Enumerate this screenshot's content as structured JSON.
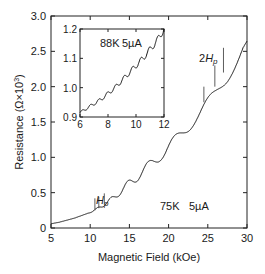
{
  "chart_data": [
    {
      "id": "main",
      "type": "line",
      "title": "",
      "xlabel": "Magnetic Field (kOe)",
      "ylabel": "Resistance (Ω×10",
      "ylabel_sup": "3",
      "ylabel_close": ")",
      "xlim": [
        5,
        30
      ],
      "ylim": [
        0,
        3.0
      ],
      "xticks": [
        5,
        10,
        15,
        20,
        25,
        30
      ],
      "xtick_labels": [
        "5",
        "10",
        "15",
        "20",
        "25",
        "30"
      ],
      "yticks": [
        0,
        0.5,
        1.0,
        1.5,
        2.0,
        2.5,
        3.0
      ],
      "ytick_labels": [
        "0",
        "0.5",
        "1.0",
        "1.5",
        "2.0",
        "2.5",
        "3.0"
      ],
      "grid": false,
      "series": [
        {
          "name": "75K 5µA",
          "x": [
            5,
            6,
            7,
            8,
            9,
            10,
            10.5,
            11,
            11.5,
            12,
            12.5,
            13,
            13.5,
            14,
            14.5,
            15,
            15.5,
            16,
            16.5,
            17,
            17.5,
            18,
            18.5,
            19,
            19.5,
            20,
            20.5,
            21,
            21.5,
            22,
            22.5,
            23,
            23.5,
            24,
            24.5,
            25,
            25.5,
            26,
            26.5,
            27,
            27.5,
            28,
            28.5,
            29,
            29.5,
            30
          ],
          "y": [
            0.06,
            0.08,
            0.11,
            0.14,
            0.18,
            0.22,
            0.25,
            0.28,
            0.31,
            0.35,
            0.39,
            0.43,
            0.48,
            0.53,
            0.58,
            0.63,
            0.68,
            0.73,
            0.78,
            0.83,
            0.88,
            0.93,
            0.98,
            1.03,
            1.08,
            1.14,
            1.2,
            1.26,
            1.32,
            1.38,
            1.44,
            1.5,
            1.56,
            1.62,
            1.69,
            1.76,
            1.83,
            1.9,
            1.98,
            2.06,
            2.15,
            2.25,
            2.35,
            2.45,
            2.55,
            2.6
          ],
          "oscillation_period_kOe": 0.6,
          "oscillation_amplitude": 0.06
        }
      ],
      "annotations": [
        {
          "text": "Hp",
          "italic": true,
          "x": 11.0,
          "y": 0.45
        },
        {
          "text": "2Hp",
          "italic": true,
          "prefix": "2",
          "x": 25.8,
          "y": 2.4
        },
        {
          "text": "75K",
          "x": 21.5,
          "y": 0.3
        },
        {
          "text": "5µA",
          "x": 24.8,
          "y": 0.3
        }
      ],
      "marker_lines": [
        {
          "x": 10.6,
          "y_from": 0.25,
          "y_to": 0.42
        },
        {
          "x": 11.1,
          "y_from": 0.28,
          "y_to": 0.44
        },
        {
          "x": 11.8,
          "y_from": 0.33,
          "y_to": 0.49
        },
        {
          "x": 24.5,
          "y_from": 1.78,
          "y_to": 2.0
        },
        {
          "x": 25.9,
          "y_from": 2.0,
          "y_to": 2.3
        },
        {
          "x": 27.0,
          "y_from": 2.2,
          "y_to": 2.55
        }
      ]
    },
    {
      "id": "inset",
      "type": "line",
      "title": "",
      "xlabel": "",
      "ylabel": "",
      "xlim": [
        6,
        12
      ],
      "ylim": [
        0.9,
        1.2
      ],
      "xticks": [
        6,
        8,
        10,
        12
      ],
      "xtick_labels": [
        "6",
        "8",
        "10",
        "12"
      ],
      "yticks": [
        0.9,
        1.0,
        1.1,
        1.2
      ],
      "ytick_labels": [
        "0.9",
        "1.0",
        "1.1",
        "1.2"
      ],
      "grid": false,
      "series": [
        {
          "name": "88K 5µA",
          "x": [
            6,
            6.5,
            7,
            7.5,
            8,
            8.5,
            9,
            9.5,
            10,
            10.5,
            11,
            11.5,
            12
          ],
          "y": [
            0.915,
            0.93,
            0.945,
            0.96,
            0.98,
            1.0,
            1.025,
            1.05,
            1.075,
            1.1,
            1.13,
            1.16,
            1.2
          ],
          "oscillation_period_kOe": 0.6,
          "oscillation_amplitude": 0.008
        }
      ],
      "annotations": [
        {
          "text": "88K",
          "x": 8.1,
          "y": 1.155
        },
        {
          "text": "5µA",
          "x": 9.6,
          "y": 1.155
        }
      ]
    }
  ]
}
